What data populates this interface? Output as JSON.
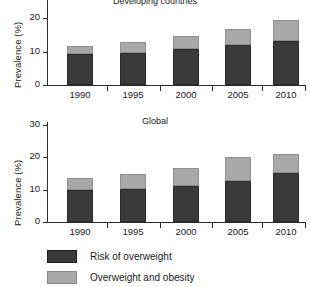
{
  "chart_data": [
    {
      "type": "bar",
      "id": "top",
      "title": "Developing countries",
      "title_truncated": true,
      "categories": [
        "1990",
        "1995",
        "2000",
        "2005",
        "2010"
      ],
      "xlabel": "",
      "ylabel": "Prevalence (%)",
      "ylim": [
        0,
        30
      ],
      "yticks": [
        0,
        10,
        20
      ],
      "ytick_labels": [
        "0",
        "10",
        "20"
      ],
      "grid": false,
      "stacked": true,
      "legend_position": "below-figure",
      "series": [
        {
          "name": "Risk of overweight",
          "color": "#3a3a3a",
          "values": [
            9.3,
            9.5,
            10.7,
            11.9,
            13.0
          ]
        },
        {
          "name": "Overweight and obesity",
          "color": "#a8a8a8",
          "values": [
            2.4,
            3.3,
            4.0,
            4.8,
            6.5
          ]
        }
      ],
      "totals": [
        11.7,
        12.8,
        14.7,
        16.7,
        19.5
      ]
    },
    {
      "type": "bar",
      "id": "bottom",
      "title": "Global",
      "title_truncated": false,
      "categories": [
        "1990",
        "1995",
        "2000",
        "2005",
        "2010"
      ],
      "xlabel": "",
      "ylabel": "Prevalence (%)",
      "ylim": [
        0,
        30
      ],
      "yticks": [
        0,
        10,
        20,
        30
      ],
      "ytick_labels": [
        "0",
        "10",
        "20",
        "30"
      ],
      "grid": false,
      "stacked": true,
      "legend_position": "below-figure",
      "series": [
        {
          "name": "Risk of overweight",
          "color": "#3a3a3a",
          "values": [
            9.9,
            10.3,
            11.0,
            12.7,
            15.0
          ]
        },
        {
          "name": "Overweight and obesity",
          "color": "#a8a8a8",
          "values": [
            3.7,
            4.4,
            5.6,
            7.2,
            5.9
          ]
        }
      ],
      "totals": [
        13.6,
        14.7,
        16.6,
        19.9,
        20.9
      ]
    }
  ],
  "legend": {
    "items": [
      {
        "label": "Risk of overweight",
        "color": "#3a3a3a"
      },
      {
        "label": "Overweight and obesity",
        "color": "#a8a8a8"
      }
    ]
  }
}
